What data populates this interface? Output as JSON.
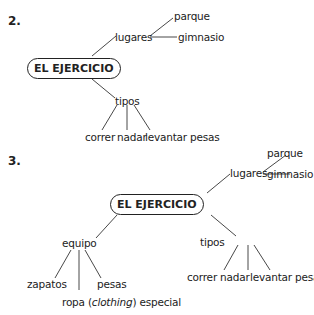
{
  "diagrams": [
    {
      "number": "2.",
      "center": "EL EJERCICIO",
      "branches": {
        "lugares": {
          "label": "lugares",
          "children": [
            "parque",
            "gimnasio"
          ]
        },
        "tipos": {
          "label": "tipos",
          "children": [
            "correr",
            "nadar",
            "levantar pesas"
          ]
        }
      }
    },
    {
      "number": "3.",
      "center": "EL EJERCICIO",
      "branches": {
        "lugares": {
          "label": "lugares",
          "children": [
            "parque",
            "gimnasio"
          ]
        },
        "tipos": {
          "label": "tipos",
          "children": [
            "correr",
            "nadar",
            "levantar pesas"
          ]
        },
        "equipo": {
          "label": "equipo",
          "children": [
            "zapatos",
            "pesas"
          ],
          "ropa": {
            "pre": "ropa (",
            "italic": "clothing",
            "post": ") especial"
          }
        }
      }
    }
  ]
}
